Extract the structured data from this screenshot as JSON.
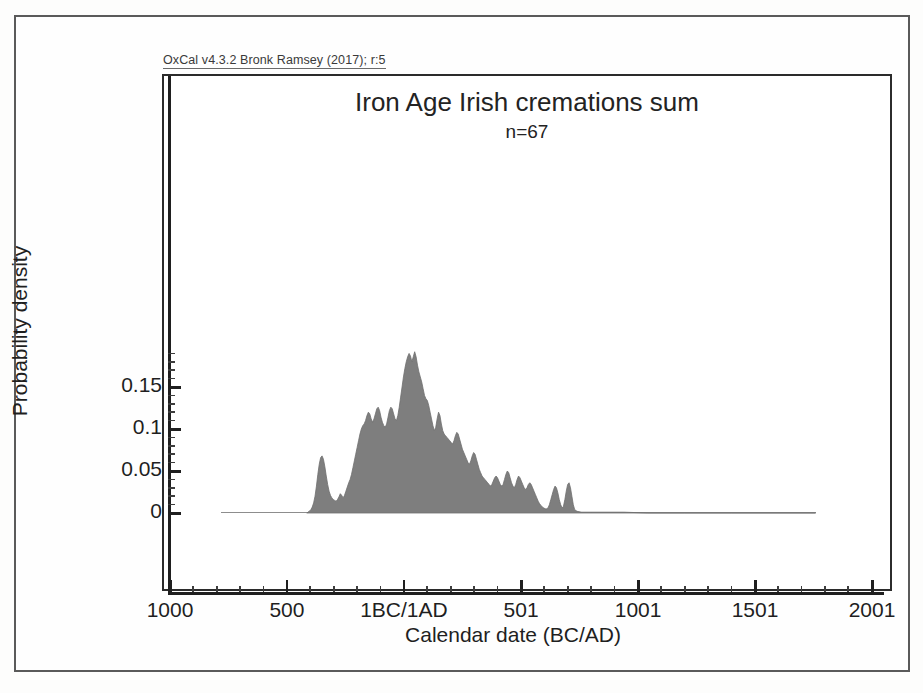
{
  "credit": {
    "text": "OxCal v4.3.2 Bronk Ramsey (2017); r:5"
  },
  "chart_data": {
    "type": "area",
    "title": "Iron Age Irish cremations sum",
    "subtitle": "n=67",
    "xlabel": "Calendar date (BC/AD)",
    "ylabel": "Probability density",
    "xlim": [
      -1000,
      2001
    ],
    "ylim": [
      0,
      0.2
    ],
    "grid": false,
    "legend": "none",
    "fill_color": "#7e7e7e",
    "line_color": "#6e6e6e",
    "x_tick_labels": [
      "1000",
      "500",
      "1BC/1AD",
      "501",
      "1001",
      "1501",
      "2001"
    ],
    "x_tick_values": [
      -1000,
      -500,
      0,
      501,
      1001,
      1501,
      2001
    ],
    "x_minor_interval": 100,
    "y_tick_labels": [
      "0",
      "0.05",
      "0.1",
      "0.15"
    ],
    "y_tick_values": [
      0,
      0.05,
      0.1,
      0.15
    ],
    "y_minor_interval": 0.01,
    "baseline_range": [
      -780,
      1760
    ],
    "x": [
      -415,
      -405,
      -398,
      -392,
      -386,
      -380,
      -374,
      -368,
      -362,
      -356,
      -350,
      -344,
      -338,
      -332,
      -326,
      -320,
      -314,
      -308,
      -302,
      -296,
      -290,
      -284,
      -278,
      -272,
      -266,
      -260,
      -254,
      -248,
      -242,
      -236,
      -230,
      -224,
      -218,
      -212,
      -206,
      -200,
      -194,
      -188,
      -182,
      -176,
      -170,
      -164,
      -158,
      -152,
      -146,
      -140,
      -134,
      -128,
      -122,
      -116,
      -110,
      -104,
      -98,
      -92,
      -86,
      -80,
      -74,
      -68,
      -62,
      -56,
      -50,
      -44,
      -38,
      -32,
      -26,
      -20,
      -14,
      -8,
      -2,
      4,
      10,
      16,
      22,
      28,
      34,
      40,
      46,
      52,
      58,
      64,
      70,
      76,
      82,
      88,
      94,
      100,
      106,
      112,
      118,
      124,
      130,
      136,
      142,
      148,
      154,
      160,
      166,
      172,
      178,
      184,
      190,
      196,
      202,
      208,
      214,
      220,
      226,
      232,
      238,
      244,
      250,
      256,
      262,
      268,
      274,
      280,
      286,
      292,
      298,
      304,
      310,
      316,
      322,
      328,
      334,
      340,
      346,
      352,
      358,
      364,
      370,
      376,
      382,
      388,
      394,
      400,
      406,
      412,
      418,
      424,
      430,
      436,
      442,
      448,
      454,
      460,
      466,
      472,
      478,
      484,
      490,
      496,
      502,
      508,
      514,
      520,
      526,
      532,
      538,
      544,
      550,
      556,
      562,
      568,
      574,
      580,
      586,
      592,
      598,
      604,
      610,
      616,
      622,
      628,
      634,
      640,
      646,
      652,
      658,
      664,
      670,
      676,
      682,
      688,
      694,
      700,
      706,
      712,
      718,
      724,
      730,
      740,
      760,
      800,
      860,
      940,
      1040,
      1200,
      1400,
      1760
    ],
    "y": [
      0.0,
      0.002,
      0.004,
      0.007,
      0.012,
      0.02,
      0.032,
      0.046,
      0.058,
      0.066,
      0.068,
      0.064,
      0.055,
      0.044,
      0.034,
      0.026,
      0.021,
      0.018,
      0.016,
      0.015,
      0.014,
      0.016,
      0.019,
      0.023,
      0.021,
      0.018,
      0.021,
      0.026,
      0.031,
      0.036,
      0.04,
      0.046,
      0.054,
      0.062,
      0.07,
      0.078,
      0.086,
      0.094,
      0.1,
      0.104,
      0.106,
      0.11,
      0.116,
      0.12,
      0.118,
      0.112,
      0.108,
      0.112,
      0.118,
      0.124,
      0.126,
      0.122,
      0.114,
      0.108,
      0.104,
      0.102,
      0.106,
      0.114,
      0.122,
      0.126,
      0.124,
      0.118,
      0.112,
      0.11,
      0.116,
      0.126,
      0.138,
      0.15,
      0.162,
      0.172,
      0.18,
      0.186,
      0.19,
      0.187,
      0.18,
      0.186,
      0.192,
      0.186,
      0.176,
      0.168,
      0.162,
      0.156,
      0.148,
      0.14,
      0.136,
      0.134,
      0.128,
      0.12,
      0.112,
      0.104,
      0.098,
      0.102,
      0.112,
      0.12,
      0.116,
      0.106,
      0.098,
      0.094,
      0.092,
      0.09,
      0.088,
      0.086,
      0.084,
      0.082,
      0.086,
      0.092,
      0.096,
      0.094,
      0.088,
      0.082,
      0.076,
      0.072,
      0.068,
      0.064,
      0.06,
      0.058,
      0.062,
      0.068,
      0.072,
      0.07,
      0.064,
      0.058,
      0.052,
      0.048,
      0.044,
      0.042,
      0.04,
      0.038,
      0.036,
      0.034,
      0.032,
      0.034,
      0.038,
      0.042,
      0.044,
      0.042,
      0.038,
      0.034,
      0.032,
      0.034,
      0.04,
      0.046,
      0.05,
      0.048,
      0.042,
      0.036,
      0.032,
      0.03,
      0.034,
      0.04,
      0.044,
      0.042,
      0.038,
      0.034,
      0.03,
      0.028,
      0.03,
      0.034,
      0.036,
      0.034,
      0.03,
      0.026,
      0.022,
      0.018,
      0.014,
      0.011,
      0.009,
      0.007,
      0.006,
      0.005,
      0.005,
      0.006,
      0.01,
      0.016,
      0.022,
      0.028,
      0.032,
      0.03,
      0.024,
      0.016,
      0.01,
      0.006,
      0.008,
      0.016,
      0.026,
      0.034,
      0.036,
      0.03,
      0.02,
      0.01,
      0.004,
      0.002,
      0.001,
      0.001,
      0.001,
      0.001,
      0.0,
      0.0,
      0.0,
      0.0
    ]
  }
}
